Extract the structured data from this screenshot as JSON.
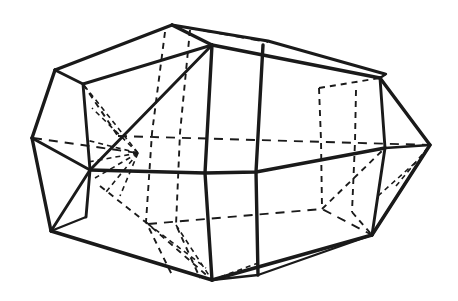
{
  "figure": {
    "background_color": "#ffffff",
    "line_color": "#1a1a1a",
    "canvas": {
      "width": 458,
      "height": 301
    },
    "style": {
      "visible_edge": "solid",
      "hidden_edge": "dashed"
    },
    "labels": [],
    "caption": ""
  },
  "geometry": {
    "vertices": {
      "top_apex": [
        172,
        25
      ],
      "top_front": [
        212,
        45
      ],
      "top_right_ridge": [
        268,
        42
      ],
      "upper_left": [
        55,
        70
      ],
      "upper_left_inner": [
        83,
        82
      ],
      "upper_right": [
        380,
        78
      ],
      "upper_right_inner": [
        357,
        88
      ],
      "left_point": [
        32,
        138
      ],
      "left_inner": [
        88,
        133
      ],
      "right_point": [
        430,
        145
      ],
      "right_inner": [
        385,
        148
      ],
      "mid_left_front": [
        90,
        170
      ],
      "hidden_center": [
        138,
        153
      ],
      "bottom_left": [
        51,
        231
      ],
      "bottom_left_inner": [
        86,
        217
      ],
      "bottom_apex": [
        212,
        280
      ],
      "bottom_right": [
        372,
        235
      ],
      "bottom_right_inner": [
        352,
        223
      ],
      "front_band_upper_a": [
        212,
        45
      ],
      "front_band_upper_b": [
        263,
        45
      ],
      "front_band_lower_a": [
        212,
        280
      ],
      "front_band_lower_b": [
        258,
        275
      ],
      "mid_front_a": [
        205,
        173
      ],
      "mid_front_b": [
        256,
        172
      ]
    },
    "edge_counts": {
      "solid_edges": 29,
      "dashed_edges": 21
    }
  }
}
